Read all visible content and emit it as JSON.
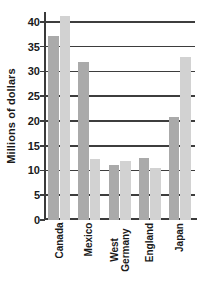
{
  "chart_data": {
    "type": "bar",
    "title": "",
    "subtitle": "",
    "xlabel": "",
    "ylabel": "Millions of dollars",
    "ylim": [
      0,
      42
    ],
    "yticks": [
      0,
      5,
      10,
      15,
      20,
      25,
      30,
      35,
      40
    ],
    "ytick_labels": [
      "0",
      "5",
      "10",
      "15",
      "20",
      "25",
      "30",
      "35",
      "40"
    ],
    "grid": "horizontal",
    "legend": "none",
    "categories": [
      {
        "label": "Canada",
        "lines": [
          "Canada"
        ]
      },
      {
        "label": "Mexico",
        "lines": [
          "Mexico"
        ]
      },
      {
        "label": "West Germany",
        "lines": [
          "West",
          "Germany"
        ]
      },
      {
        "label": "England",
        "lines": [
          "England"
        ]
      },
      {
        "label": "Japan",
        "lines": [
          "Japan"
        ]
      }
    ],
    "series": [
      {
        "name": "Series 1",
        "color": "#aaaaaa",
        "values": [
          37.2,
          32.0,
          11.1,
          12.5,
          20.8
        ]
      },
      {
        "name": "Series 2",
        "color": "#d2d2d2",
        "values": [
          41.1,
          12.4,
          12.0,
          10.6,
          33.0
        ]
      }
    ],
    "axis_color": "#3d3d3d",
    "background": "#ffffff"
  }
}
